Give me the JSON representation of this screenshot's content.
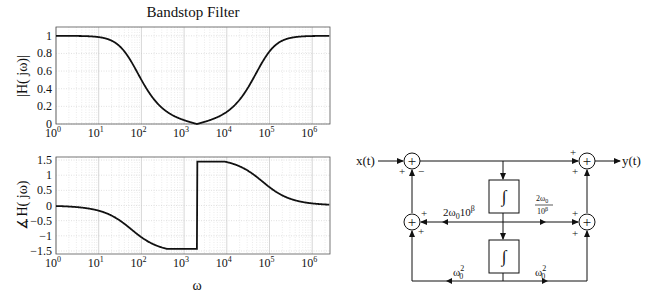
{
  "title": "Bandstop Filter",
  "chart_data": [
    {
      "type": "line",
      "title": "Bandstop Filter",
      "xlabel": "",
      "ylabel": "|H( jω)|",
      "xscale": "log",
      "xlim_log10": [
        0,
        6.4
      ],
      "ylim": [
        0,
        1.1
      ],
      "grid": true,
      "xticks": [
        "10^0",
        "10^1",
        "10^2",
        "10^3",
        "10^4",
        "10^5",
        "10^6"
      ],
      "yticks": [
        "0",
        "0.2",
        "0.4",
        "0.6",
        "0.8",
        "1"
      ],
      "x": [
        1,
        6.3,
        15.85,
        39.8,
        100,
        251,
        631,
        1585,
        2000,
        3981,
        10000,
        25119,
        63096,
        158489,
        398107,
        1000000,
        2511886
      ],
      "values": [
        1.0,
        0.994,
        0.964,
        0.824,
        0.5,
        0.222,
        0.082,
        0.014,
        0.0,
        0.043,
        0.138,
        0.34,
        0.675,
        0.917,
        0.985,
        0.998,
        1.0
      ]
    },
    {
      "type": "line",
      "title": "",
      "xlabel": "ω",
      "ylabel": "∡H( jω)",
      "xscale": "log",
      "xlim_log10": [
        0,
        6.4
      ],
      "ylim": [
        -1.6,
        1.6
      ],
      "grid": true,
      "xticks": [
        "10^0",
        "10^1",
        "10^2",
        "10^3",
        "10^4",
        "10^5",
        "10^6"
      ],
      "yticks": [
        "-1.5",
        "-1",
        "-0.5",
        "0",
        "0.5",
        "1",
        "1.5"
      ],
      "x": [
        1,
        6.3,
        15.85,
        39.8,
        100,
        251,
        631,
        1585,
        1900,
        2100,
        3981,
        10000,
        25119,
        63096,
        158489,
        398107,
        1000000,
        2511886
      ],
      "values": [
        -0.017,
        -0.108,
        -0.267,
        -0.602,
        -1.047,
        -1.347,
        -1.43,
        -1.43,
        -1.3,
        1.3,
        1.45,
        1.433,
        1.223,
        0.83,
        0.41,
        0.172,
        0.069,
        0.027
      ]
    }
  ],
  "plots": {
    "magnitude": {
      "ylabel": "|H( jω)|",
      "yticks": [
        "0",
        "0.2",
        "0.4",
        "0.6",
        "0.8",
        "1"
      ],
      "xtick_exp": [
        "0",
        "1",
        "2",
        "3",
        "4",
        "5",
        "6"
      ]
    },
    "phase": {
      "ylabel": "∡H( jω)",
      "yticks": [
        "-1.5",
        "-1",
        "-0.5",
        "0",
        "0.5",
        "1",
        "1.5"
      ],
      "xtick_exp": [
        "0",
        "1",
        "2",
        "3",
        "4",
        "5",
        "6"
      ],
      "xlabel": "ω"
    },
    "params": {
      "omega0": 2000,
      "bandwidth": 69000
    }
  },
  "diagram": {
    "input_label": "x(t)",
    "output_label": "y(t)",
    "summer_glyph": "+",
    "integrator_glyph": "∫",
    "signs": {
      "top_left_in": "+",
      "top_left_feedback": "−",
      "top_right_top": "+",
      "top_right_bottom": "+",
      "mid_left_top": "+",
      "mid_left_bottom": "+",
      "mid_right_top": "+",
      "mid_right_bottom": "+"
    },
    "gains": {
      "left_mid_base": "2ω",
      "left_mid_sub": "0",
      "left_mid_tail": "10",
      "left_mid_sup": "β",
      "right_mid_num_base": "2ω",
      "right_mid_num_sub": "0",
      "right_mid_den_base": "10",
      "right_mid_den_sup": "β",
      "bottom_base": "ω",
      "bottom_sub": "0",
      "bottom_sup": "2"
    }
  }
}
